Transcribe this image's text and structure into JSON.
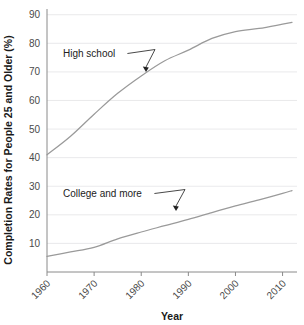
{
  "chart_data": {
    "type": "line",
    "title": "",
    "xlabel": "Year",
    "ylabel": "Completion Rates for People 25 and Older (%)",
    "xlim": [
      1960,
      2012
    ],
    "ylim": [
      0,
      92
    ],
    "grid": true,
    "legend_position": "inline-annotations",
    "x_ticks": [
      1960,
      1970,
      1980,
      1990,
      2000,
      2010
    ],
    "x_tick_labels": [
      "1960",
      "1970",
      "1980",
      "1990",
      "2000",
      "2010"
    ],
    "y_ticks": [
      10,
      20,
      30,
      40,
      50,
      60,
      70,
      80,
      90
    ],
    "y_tick_labels": [
      "10",
      "20",
      "30",
      "40",
      "50",
      "60",
      "70",
      "80",
      "90"
    ],
    "x": [
      1960,
      1965,
      1970,
      1975,
      1980,
      1985,
      1990,
      1995,
      2000,
      2005,
      2010,
      2012
    ],
    "series": [
      {
        "name": "High school",
        "values": [
          41.0,
          47.5,
          55.2,
          62.5,
          68.6,
          73.9,
          77.6,
          81.7,
          84.1,
          85.2,
          86.7,
          87.3
        ]
      },
      {
        "name": "College and more",
        "values": [
          5.5,
          7.0,
          8.6,
          11.6,
          14.0,
          16.2,
          18.4,
          20.8,
          23.1,
          25.2,
          27.5,
          28.5
        ]
      }
    ],
    "annotations": [
      {
        "text": "High school",
        "target_x": 1982,
        "target_y": 70
      },
      {
        "text": "College and more",
        "target_x": 1991,
        "target_y": 20
      }
    ]
  }
}
